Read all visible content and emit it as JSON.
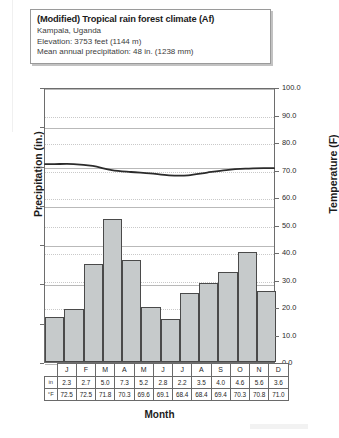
{
  "info": {
    "title": "(Modified) Tropical rain forest climate (Af)",
    "location": "Kampala, Uganda",
    "elevation": "Elevation: 3753 feet (1144 m)",
    "precipitation": "Mean annual precipitation:  48 in. (1238 mm)"
  },
  "axes": {
    "left_title": "Precipitation (in.)",
    "right_title": "Temperature (F)",
    "x_title": "Month",
    "left_ticks": [
      "0.0",
      "2.0",
      "4.0",
      "6.0",
      "8.0",
      "10.0",
      "12.0",
      "14.0"
    ],
    "right_ticks": [
      "0.0",
      "10.0",
      "20.0",
      "30.0",
      "40.0",
      "50.0",
      "60.0",
      "70.0",
      "80.0",
      "90.0",
      "100.0"
    ]
  },
  "table": {
    "row_head_precip": "in",
    "row_head_temp": "°F"
  },
  "chart_data": {
    "type": "bar",
    "title": "(Modified) Tropical rain forest climate (Af)",
    "subtitle": "Kampala, Uganda",
    "xlabel": "Month",
    "ylabel": "Precipitation (in.)",
    "y2label": "Temperature (F)",
    "ylim": [
      0,
      14
    ],
    "y2lim": [
      0,
      100
    ],
    "grid": true,
    "legend": "none",
    "categories": [
      "J",
      "F",
      "M",
      "A",
      "M",
      "J",
      "J",
      "A",
      "S",
      "O",
      "N",
      "D"
    ],
    "series": [
      {
        "name": "Precipitation (in.)",
        "type": "bar",
        "axis": "left",
        "values": [
          2.3,
          2.7,
          5.0,
          7.3,
          5.2,
          2.8,
          2.2,
          3.5,
          4.0,
          4.6,
          5.6,
          3.6
        ]
      },
      {
        "name": "Temperature (F)",
        "type": "line",
        "axis": "right",
        "values": [
          72.5,
          72.5,
          71.8,
          70.3,
          69.6,
          69.1,
          68.4,
          68.4,
          69.4,
          70.3,
          70.8,
          71.0
        ]
      }
    ]
  }
}
